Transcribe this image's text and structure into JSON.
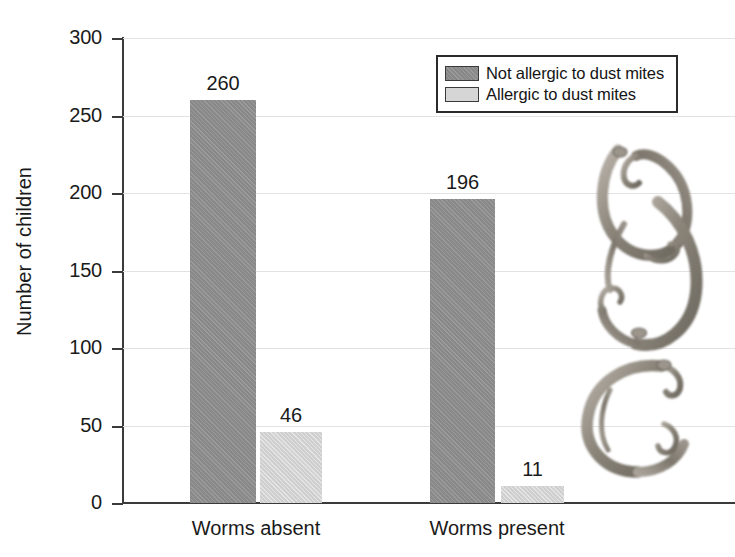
{
  "chart_data": {
    "type": "bar",
    "title": "",
    "xlabel": "",
    "ylabel": "Number of children",
    "categories": [
      "Worms absent",
      "Worms present"
    ],
    "series": [
      {
        "name": "Not allergic to dust mites",
        "values": [
          260,
          196
        ],
        "color": "#8f8f8f"
      },
      {
        "name": "Allergic to dust mites",
        "values": [
          46,
          11
        ],
        "color": "#d6d6d6"
      }
    ],
    "ylim": [
      0,
      300
    ],
    "yticks": [
      0,
      50,
      100,
      150,
      200,
      250,
      300
    ],
    "ytick_labels": [
      "0",
      "50",
      "100",
      "150",
      "200",
      "250",
      "300"
    ],
    "grid": true,
    "legend_position": "top-right",
    "bar_value_labels": [
      [
        "260",
        "46"
      ],
      [
        "196",
        "11"
      ]
    ]
  },
  "axis": {
    "y_title": "Number of children",
    "ticks": [
      {
        "label": "300",
        "value": 300
      },
      {
        "label": "250",
        "value": 250
      },
      {
        "label": "200",
        "value": 200
      },
      {
        "label": "150",
        "value": 150
      },
      {
        "label": "100",
        "value": 100
      },
      {
        "label": "50",
        "value": 50
      },
      {
        "label": "0",
        "value": 0
      }
    ]
  },
  "legend": {
    "items": [
      {
        "label": "Not allergic to dust mites",
        "swatch": "dark"
      },
      {
        "label": "Allergic to dust mites",
        "swatch": "light"
      }
    ]
  },
  "bars": [
    {
      "group": "Worms absent",
      "series": "Not allergic to dust mites",
      "value": 260,
      "label": "260",
      "style": "dark",
      "x": 190,
      "w": 66
    },
    {
      "group": "Worms absent",
      "series": "Allergic to dust mites",
      "value": 46,
      "label": "46",
      "style": "light",
      "x": 260,
      "w": 62
    },
    {
      "group": "Worms present",
      "series": "Not allergic to dust mites",
      "value": 196,
      "label": "196",
      "style": "dark",
      "x": 430,
      "w": 65
    },
    {
      "group": "Worms present",
      "series": "Allergic to dust mites",
      "value": 11,
      "label": "11",
      "style": "light",
      "x": 501,
      "w": 63
    }
  ],
  "category_labels": [
    {
      "text": "Worms absent",
      "center": 256
    },
    {
      "text": "Worms present",
      "center": 497
    }
  ],
  "illustration": {
    "name": "parasitic-worms-photo",
    "description": "Photographic illustration of coiled parasitic worms"
  }
}
